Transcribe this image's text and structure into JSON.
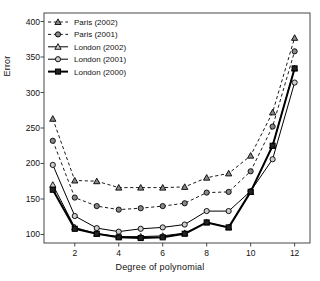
{
  "chart_data": {
    "type": "line",
    "title": "",
    "xlabel": "Degree of polynomial",
    "ylabel": "Error",
    "x": [
      1,
      2,
      3,
      4,
      5,
      6,
      7,
      8,
      9,
      10,
      11,
      12
    ],
    "xlim": [
      0.6,
      12.7
    ],
    "ylim": [
      88,
      412
    ],
    "xticks": [
      2,
      4,
      6,
      8,
      10,
      12
    ],
    "yticks": [
      100,
      150,
      200,
      250,
      300,
      350,
      400
    ],
    "grid": false,
    "legend_position": "top-left",
    "series": [
      {
        "name": "Paris (2002)",
        "marker": "triangle",
        "fill": "#888888",
        "line": "dashed",
        "color": "#000000",
        "values": [
          263,
          176,
          175,
          166,
          166,
          166,
          167,
          180,
          186,
          211,
          272,
          377
        ]
      },
      {
        "name": "Paris (2001)",
        "marker": "circle",
        "fill": "#888888",
        "line": "dashed",
        "color": "#000000",
        "values": [
          232,
          152,
          140,
          135,
          137,
          140,
          144,
          159,
          160,
          189,
          252,
          358
        ]
      },
      {
        "name": "London (2002)",
        "marker": "triangle",
        "fill": "#cccccc",
        "line": "solid-thin",
        "color": "#000000",
        "values": [
          170,
          110,
          101,
          97,
          97,
          98,
          102,
          117,
          110,
          160,
          225,
          334
        ]
      },
      {
        "name": "London (2001)",
        "marker": "circle",
        "fill": "#cccccc",
        "line": "solid-thin",
        "color": "#000000",
        "values": [
          198,
          126,
          109,
          104,
          108,
          110,
          114,
          133,
          133,
          161,
          206,
          314
        ]
      },
      {
        "name": "London (2000)",
        "marker": "square",
        "fill": "#222222",
        "line": "solid-thick",
        "color": "#000000",
        "values": [
          163,
          108,
          101,
          96,
          95,
          96,
          101,
          117,
          110,
          160,
          225,
          334
        ]
      }
    ]
  },
  "legend": {
    "items": [
      {
        "label": "Paris (2002)"
      },
      {
        "label": "Paris (2001)"
      },
      {
        "label": "London (2002)"
      },
      {
        "label": "London (2001)"
      },
      {
        "label": "London (2000)"
      }
    ]
  },
  "axes": {
    "x_label": "Degree of polynomial",
    "y_label": "Error",
    "x_tick_labels": [
      "2",
      "4",
      "6",
      "8",
      "10",
      "12"
    ],
    "y_tick_labels": [
      "100",
      "150",
      "200",
      "250",
      "300",
      "350",
      "400"
    ]
  }
}
